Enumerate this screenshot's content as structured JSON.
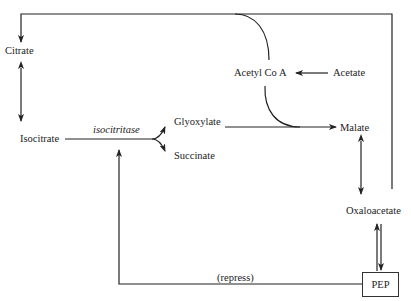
{
  "diagram": {
    "nodes": {
      "citrate": "Citrate",
      "isocitrate": "Isocitrate",
      "glyoxylate": "Glyoxylate",
      "succinate": "Succinate",
      "acetyl_coa": "Acetyl Co A",
      "acetate": "Acetate",
      "malate": "Malate",
      "oxaloacetate": "Oxaloacetate",
      "pep": "PEP"
    },
    "edge_labels": {
      "enzyme": "isocitritase",
      "repress": "(repress)"
    },
    "edges": [
      {
        "from": "Acetyl Co A",
        "to": "Citrate",
        "type": "arrow"
      },
      {
        "from": "Citrate",
        "to": "Isocitrate",
        "type": "bidirectional"
      },
      {
        "from": "Isocitrate",
        "to": "Glyoxylate",
        "type": "arrow",
        "label": "isocitritase"
      },
      {
        "from": "Isocitrate",
        "to": "Succinate",
        "type": "arrow",
        "label": "isocitritase"
      },
      {
        "from": "Acetate",
        "to": "Acetyl Co A",
        "type": "arrow"
      },
      {
        "from": "Glyoxylate",
        "to": "Malate",
        "type": "arrow"
      },
      {
        "from": "Acetyl Co A",
        "to": "Malate",
        "type": "join"
      },
      {
        "from": "Malate",
        "to": "Oxaloacetate",
        "type": "bidirectional"
      },
      {
        "from": "Oxaloacetate",
        "to": "PEP",
        "type": "arrow"
      },
      {
        "from": "PEP",
        "to": "Oxaloacetate",
        "type": "arrow"
      },
      {
        "from": "PEP",
        "to": "isocitritase",
        "type": "inhibition",
        "label": "(repress)"
      }
    ],
    "colors": {
      "line": "#222222",
      "background": "#ffffff"
    }
  }
}
